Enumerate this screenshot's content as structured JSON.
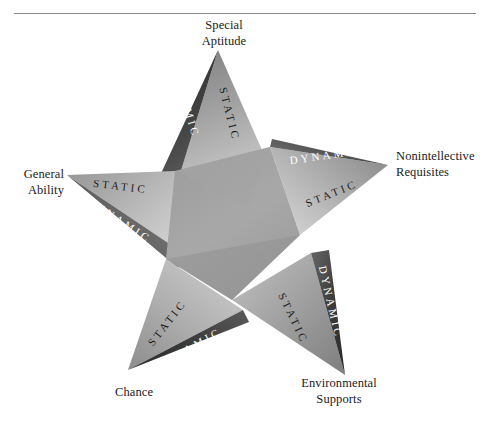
{
  "figure": {
    "background_color": "#ffffff",
    "has_top_rule": true,
    "shape": "five-pointed-star",
    "vertex_labels": [
      {
        "id": "special-aptitude",
        "text": "Special\nAptitude",
        "position": "top"
      },
      {
        "id": "nonintellective",
        "text": "Nonintellective\nRequisites",
        "position": "right"
      },
      {
        "id": "general-ability",
        "text": "General\nAbility",
        "position": "left"
      },
      {
        "id": "chance",
        "text": "Chance",
        "position": "bottom-left"
      },
      {
        "id": "environmental-supports",
        "text": "Environmental\nSupports",
        "position": "bottom-right"
      }
    ],
    "band_labels": {
      "dynamic": "DYNAMIC",
      "static": "STATIC"
    },
    "points": [
      {
        "id": "point-top",
        "vertex": "special-aptitude",
        "dynamic_side": "left",
        "static_side": "right"
      },
      {
        "id": "point-right",
        "vertex": "nonintellective",
        "dynamic_side": "upper",
        "static_side": "lower"
      },
      {
        "id": "point-left",
        "vertex": "general-ability",
        "dynamic_side": "lower",
        "static_side": "upper"
      },
      {
        "id": "point-bottom-left",
        "vertex": "chance",
        "dynamic_side": "lower",
        "static_side": "upper"
      },
      {
        "id": "point-bottom-right",
        "vertex": "environmental-supports",
        "dynamic_side": "right",
        "static_side": "left"
      }
    ],
    "colors": {
      "dynamic_band_dark": "#3a3a3a",
      "dynamic_band_light": "#6e6e6e",
      "static_face_dark": "#8c8c8c",
      "static_face_light": "#d2d2d2",
      "core_overlap": "#9a9a9a",
      "label_text": "#1a1a1a",
      "band_text": "#ffffff",
      "face_text": "#1c1c1c",
      "rule": "#8a8a8a"
    }
  }
}
